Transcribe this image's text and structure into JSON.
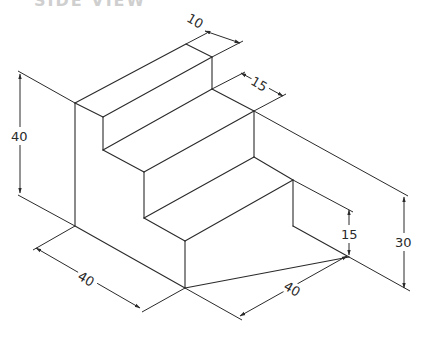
{
  "title": "SIDE VIEW",
  "drawing": {
    "type": "isometric-staircase",
    "stroke_color": "#2a2a2a",
    "background": "#ffffff",
    "dimensions": {
      "top_step_depth": "10",
      "second_step_depth": "15",
      "total_height": "40",
      "bottom_step_height": "15",
      "right_height": "30",
      "width_left": "40",
      "depth_right": "40"
    }
  }
}
